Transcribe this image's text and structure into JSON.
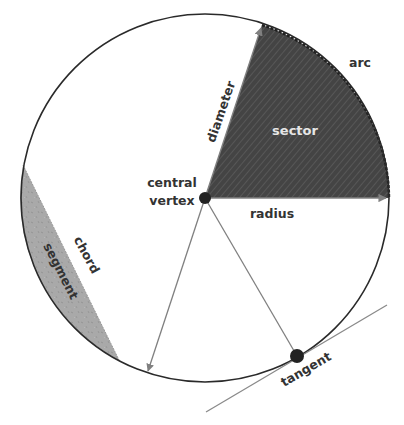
{
  "diagram": {
    "colors": {
      "circle_stroke": "#2a2a2a",
      "sector_fill": "#444444",
      "sector_hatch": "#5a5a5a",
      "segment_fill": "#aaaaaa",
      "line_gray": "#808080",
      "label_dark": "#333333",
      "label_light": "#e6e6e6",
      "dot": "#222222"
    },
    "labels": {
      "arc": "arc",
      "sector": "sector",
      "diameter": "diameter",
      "central": "central",
      "vertex": "vertex",
      "radius": "radius",
      "chord": "chord",
      "segment": "segment",
      "tangent": "tangent"
    }
  }
}
